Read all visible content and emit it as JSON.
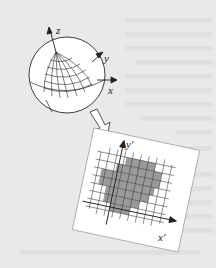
{
  "figure": {
    "sphere_axes": {
      "z": "z",
      "y": "y",
      "x": "x"
    },
    "plane_axes": {
      "x": "x'",
      "y": "y'"
    },
    "colors": {
      "background": "#e9e9e9",
      "paper": "#ffffff",
      "line": "#2a2a2a",
      "shaded_cells": "#9a9a9a"
    }
  }
}
